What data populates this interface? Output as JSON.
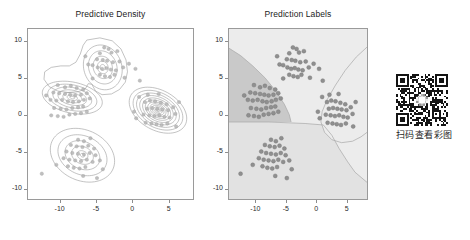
{
  "figure": {
    "background": "#ffffff",
    "width": 470,
    "height": 235
  },
  "panels": [
    {
      "id": "predictive-density",
      "title": "Predictive Density",
      "frame": {
        "left": 27,
        "top": 28,
        "width": 167,
        "height": 172
      },
      "axes": {
        "xlim": [
          -14.5,
          8.5
        ],
        "ylim": [
          -11.5,
          11.8
        ],
        "xticks": [
          "-10",
          "-5",
          "0",
          "5"
        ],
        "xtick_values": [
          -10,
          -5,
          0,
          5
        ],
        "yticks": [
          "10",
          "5",
          "0",
          "-5",
          "-10"
        ],
        "ytick_values": [
          10,
          5,
          0,
          -5,
          -10
        ],
        "grid": false,
        "frame_color": "#9a9a9a"
      }
    },
    {
      "id": "prediction-labels",
      "title": "Prediction Labels",
      "frame": {
        "left": 228,
        "top": 28,
        "width": 140,
        "height": 172
      },
      "axes": {
        "xlim": [
          -14.5,
          8.5
        ],
        "ylim": [
          -11.5,
          11.8
        ],
        "xticks": [
          "-10",
          "-5",
          "0",
          "5"
        ],
        "xtick_values": [
          -10,
          -5,
          0,
          5
        ],
        "yticks": [
          "10",
          "5",
          "0",
          "-5",
          "-10"
        ],
        "ytick_values": [
          10,
          5,
          0,
          -5,
          -10
        ],
        "grid": false,
        "frame_color": "#9a9a9a"
      }
    }
  ],
  "qr": {
    "caption": "扫码查看彩图",
    "left": 396,
    "top": 74,
    "size": 52
  },
  "chart_data": {
    "type": "scatter",
    "subtitle": "",
    "xlabel": "",
    "ylabel": "",
    "xlim": [
      -14.5,
      8.5
    ],
    "ylim": [
      -11.5,
      11.8
    ],
    "grid": false,
    "legend": "none",
    "point_color": "#8c8c8c",
    "point_edge": "#6f6f6f",
    "contour_color": "#9b9b9b",
    "region_colors": [
      "#c9c9c9",
      "#d6d6d6",
      "#e2e2e2",
      "#ececec"
    ],
    "clusters": [
      {
        "name": "upper-middle",
        "mean": [
          -4.2,
          6.6
        ],
        "n": 28
      },
      {
        "name": "left-middle",
        "mean": [
          -8.2,
          2.6
        ],
        "n": 34
      },
      {
        "name": "right",
        "mean": [
          3.4,
          0.8
        ],
        "n": 30
      },
      {
        "name": "lower-left",
        "mean": [
          -7.0,
          -5.3
        ],
        "n": 30
      }
    ],
    "points": [
      [
        -4.0,
        9.3
      ],
      [
        -3.4,
        9.1
      ],
      [
        -3.0,
        8.6
      ],
      [
        -4.6,
        8.5
      ],
      [
        -2.2,
        8.8
      ],
      [
        -5.0,
        7.7
      ],
      [
        -4.2,
        7.6
      ],
      [
        -3.6,
        7.5
      ],
      [
        -2.8,
        7.3
      ],
      [
        -1.9,
        7.4
      ],
      [
        -6.2,
        7.0
      ],
      [
        -5.6,
        6.9
      ],
      [
        -4.9,
        6.6
      ],
      [
        -4.3,
        6.4
      ],
      [
        -3.7,
        6.5
      ],
      [
        -3.1,
        6.3
      ],
      [
        -2.4,
        6.2
      ],
      [
        -1.4,
        6.6
      ],
      [
        -0.6,
        7.1
      ],
      [
        0.3,
        6.4
      ],
      [
        -4.6,
        5.6
      ],
      [
        -3.9,
        5.4
      ],
      [
        -3.2,
        5.3
      ],
      [
        -2.6,
        5.6
      ],
      [
        -5.6,
        5.1
      ],
      [
        -1.2,
        5.2
      ],
      [
        0.9,
        4.8
      ],
      [
        -6.6,
        8.1
      ],
      [
        -10.4,
        4.2
      ],
      [
        -9.4,
        3.9
      ],
      [
        -8.6,
        4.1
      ],
      [
        -7.8,
        3.8
      ],
      [
        -6.9,
        3.6
      ],
      [
        -11.0,
        3.2
      ],
      [
        -10.2,
        3.1
      ],
      [
        -9.4,
        3.0
      ],
      [
        -8.7,
        2.9
      ],
      [
        -8.0,
        2.8
      ],
      [
        -7.2,
        2.9
      ],
      [
        -6.4,
        3.1
      ],
      [
        -11.4,
        2.2
      ],
      [
        -10.6,
        2.1
      ],
      [
        -9.8,
        2.2
      ],
      [
        -9.0,
        2.0
      ],
      [
        -8.3,
        1.9
      ],
      [
        -7.5,
        2.0
      ],
      [
        -6.8,
        2.2
      ],
      [
        -6.0,
        2.4
      ],
      [
        -10.9,
        1.1
      ],
      [
        -10.0,
        1.0
      ],
      [
        -9.2,
        0.9
      ],
      [
        -8.4,
        1.1
      ],
      [
        -7.6,
        1.2
      ],
      [
        -6.9,
        1.3
      ],
      [
        -11.3,
        0.1
      ],
      [
        -10.4,
        0.0
      ],
      [
        -9.6,
        -0.1
      ],
      [
        -8.8,
        0.2
      ],
      [
        -8.0,
        0.3
      ],
      [
        -7.2,
        0.4
      ],
      [
        -6.4,
        0.6
      ],
      [
        -12.0,
        2.8
      ],
      [
        1.6,
        1.9
      ],
      [
        2.3,
        2.1
      ],
      [
        3.0,
        2.0
      ],
      [
        3.8,
        1.8
      ],
      [
        4.6,
        1.6
      ],
      [
        1.9,
        1.0
      ],
      [
        2.6,
        1.1
      ],
      [
        3.3,
        1.0
      ],
      [
        4.0,
        0.9
      ],
      [
        4.8,
        0.8
      ],
      [
        5.5,
        1.2
      ],
      [
        1.4,
        0.2
      ],
      [
        2.2,
        0.1
      ],
      [
        2.9,
        0.0
      ],
      [
        3.6,
        0.1
      ],
      [
        4.3,
        -0.1
      ],
      [
        5.0,
        -0.2
      ],
      [
        5.8,
        0.3
      ],
      [
        1.7,
        -0.9
      ],
      [
        2.5,
        -1.0
      ],
      [
        3.2,
        -1.1
      ],
      [
        3.9,
        -1.2
      ],
      [
        4.7,
        -1.0
      ],
      [
        0.4,
        -0.3
      ],
      [
        0.1,
        0.6
      ],
      [
        6.3,
        1.9
      ],
      [
        5.9,
        -1.4
      ],
      [
        2.0,
        2.9
      ],
      [
        3.5,
        3.0
      ],
      [
        0.8,
        2.6
      ],
      [
        -7.6,
        -3.2
      ],
      [
        -6.8,
        -3.4
      ],
      [
        -5.9,
        -3.0
      ],
      [
        -8.6,
        -3.9
      ],
      [
        -7.8,
        -4.1
      ],
      [
        -7.0,
        -4.2
      ],
      [
        -6.2,
        -4.0
      ],
      [
        -5.4,
        -4.4
      ],
      [
        -9.2,
        -4.8
      ],
      [
        -8.4,
        -5.0
      ],
      [
        -7.6,
        -5.1
      ],
      [
        -6.8,
        -5.2
      ],
      [
        -6.0,
        -5.0
      ],
      [
        -5.2,
        -5.3
      ],
      [
        -9.6,
        -5.7
      ],
      [
        -8.8,
        -5.9
      ],
      [
        -8.0,
        -6.0
      ],
      [
        -7.2,
        -6.1
      ],
      [
        -6.4,
        -5.9
      ],
      [
        -5.6,
        -6.2
      ],
      [
        -9.0,
        -6.8
      ],
      [
        -8.2,
        -7.0
      ],
      [
        -7.4,
        -7.1
      ],
      [
        -6.6,
        -6.9
      ],
      [
        -4.6,
        -6.0
      ],
      [
        -4.2,
        -7.2
      ],
      [
        -6.9,
        -8.1
      ],
      [
        -5.0,
        -8.4
      ],
      [
        -12.6,
        -7.8
      ],
      [
        -10.6,
        -6.6
      ]
    ]
  }
}
